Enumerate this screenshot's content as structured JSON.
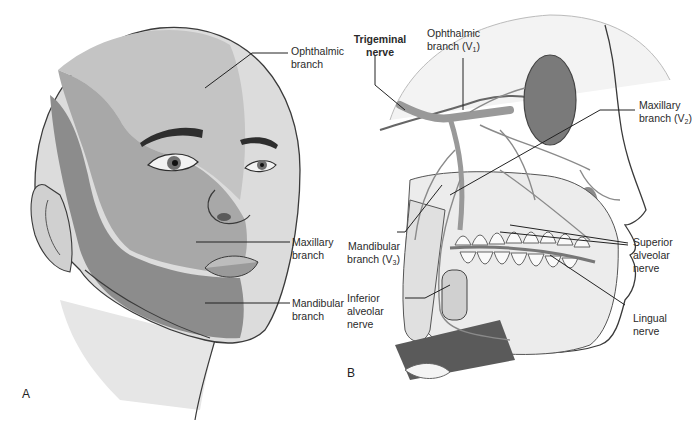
{
  "figure": {
    "panels": [
      {
        "id": "A",
        "letter": "A",
        "subject": "face-sensory-territories",
        "labels": {
          "ophthalmic": [
            "Ophthalmic",
            "branch"
          ],
          "maxillary": [
            "Maxillary",
            "branch"
          ],
          "mandibular": [
            "Mandibular",
            "branch"
          ]
        },
        "shade_colors": {
          "ophthalmic": "#c4c4c4",
          "maxillary": "#a8a8a8",
          "mandibular": "#8c8c8c",
          "skin": "#dcdcdc",
          "outline": "#3a3a3a"
        }
      },
      {
        "id": "B",
        "letter": "B",
        "subject": "trigeminal-nerve-skull",
        "labels": {
          "trigeminal": [
            "Trigeminal",
            "nerve"
          ],
          "ophthalmic_v1": {
            "line1": "Ophthalmic",
            "line2": "branch (V",
            "sub": "1",
            "close": ")"
          },
          "maxillary_v2": {
            "line1": "Maxillary",
            "line2": "branch (V",
            "sub": "2",
            "close": ")"
          },
          "mandibular_v3": {
            "line1": "Mandibular",
            "line2": "branch (V",
            "sub": "3",
            "close": ")"
          },
          "superior_alveolar": [
            "Superior",
            "alveolar",
            "nerve"
          ],
          "inferior_alveolar": [
            "Inferior",
            "alveolar",
            "nerve"
          ],
          "lingual": [
            "Lingual",
            "nerve"
          ]
        }
      }
    ]
  }
}
